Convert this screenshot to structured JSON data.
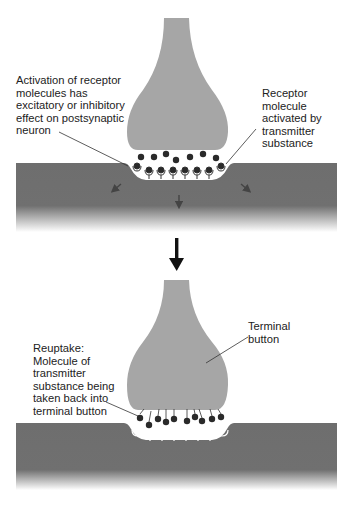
{
  "colors": {
    "terminal_button": "#a6a6a6",
    "postsynaptic_membrane": "#6e6e6e",
    "molecule": "#2a2a2a",
    "cleft": "#ffffff",
    "arrow": "#111111"
  },
  "top_panel": {
    "label_left": [
      "Activation of receptor",
      "molecules has",
      "excitatory or inhibitory",
      "effect on postsynaptic",
      "neuron"
    ],
    "label_right": [
      "Receptor",
      "molecule",
      "activated by",
      "transmitter",
      "substance"
    ]
  },
  "bottom_panel": {
    "label_left": [
      "Reuptake:",
      "Molecule of",
      "transmitter",
      "substance being",
      "taken back into",
      "terminal button"
    ],
    "label_right": [
      "Terminal",
      "button"
    ]
  },
  "icons": {
    "transition_arrow": "down-arrow-icon",
    "effect_arrows": "diagonal-arrow-icon"
  }
}
